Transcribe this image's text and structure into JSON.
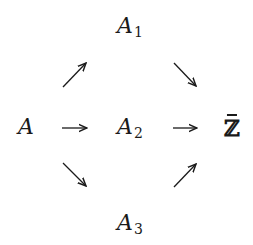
{
  "diagram": {
    "type": "commutative-diagram",
    "nodes": {
      "A": {
        "label": "A",
        "subscript": ""
      },
      "A1": {
        "label": "A",
        "subscript": "1"
      },
      "A2": {
        "label": "A",
        "subscript": "2"
      },
      "A3": {
        "label": "A",
        "subscript": "3"
      },
      "Zbar": {
        "label": "ℤ",
        "decoration": "bar"
      }
    },
    "edges": [
      {
        "from": "A",
        "to": "A1",
        "direction": "up-right"
      },
      {
        "from": "A",
        "to": "A2",
        "direction": "right"
      },
      {
        "from": "A",
        "to": "A3",
        "direction": "down-right"
      },
      {
        "from": "A1",
        "to": "Zbar",
        "direction": "down-right"
      },
      {
        "from": "A2",
        "to": "Zbar",
        "direction": "right"
      },
      {
        "from": "A3",
        "to": "Zbar",
        "direction": "up-right"
      }
    ],
    "colors": {
      "ink": "#1a1a1a",
      "background": "#ffffff"
    }
  }
}
